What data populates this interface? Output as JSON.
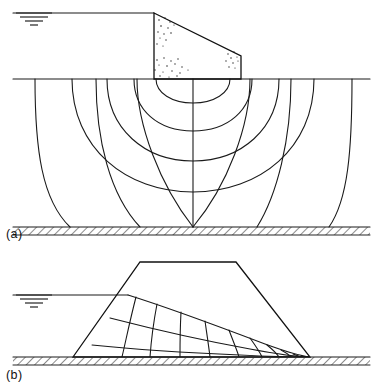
{
  "figure": {
    "background_color": "#ffffff",
    "line_color": "#1a1a1a",
    "width": 381,
    "height": 391,
    "panels": [
      {
        "id": "a",
        "label": "(a)",
        "label_x": 6,
        "label_y": 234,
        "caption": "Flow net for seepage beneath a concrete gravity dam on permeable soil",
        "structure_type": "concrete-gravity-dam",
        "ground_line": {
          "y": 79,
          "x_start": 13,
          "x_end": 370
        },
        "reservoir_water_surface": {
          "y": 13,
          "x_start": 13,
          "x_end": 154
        },
        "impermeable_base": {
          "y": 227,
          "x_start": 13,
          "x_end": 370,
          "thickness": 8
        },
        "dam_outline": [
          [
            154,
            13
          ],
          [
            241,
            56
          ],
          [
            241,
            79
          ],
          [
            154,
            79
          ]
        ],
        "flow_lines_count": 5,
        "equipotential_lines_count": 4,
        "flow_line_exit_x": [
          70,
          140,
          193,
          257,
          329
        ],
        "water_table_symbol": {
          "x": 34,
          "y": 13
        }
      },
      {
        "id": "b",
        "label": "(b)",
        "label_x": 6,
        "label_y": 375,
        "caption": "Flow net for seepage through a homogeneous earth dam with phreatic surface",
        "structure_type": "earth-embankment-dam",
        "ground_line": {
          "y": 357,
          "x_start": 13,
          "x_end": 370
        },
        "reservoir_water_surface": {
          "y": 295,
          "x_start": 13,
          "x_end": 128
        },
        "impermeable_base": {
          "y": 357,
          "x_start": 13,
          "x_end": 370,
          "thickness": 8
        },
        "dam_outline": [
          [
            73,
            357
          ],
          [
            140,
            262
          ],
          [
            236,
            262
          ],
          [
            310,
            357
          ]
        ],
        "phreatic_line_start": [
          128,
          295
        ],
        "discharge_point": [
          310,
          357
        ],
        "flow_lines_count": 3,
        "equipotential_lines_count": 9,
        "water_table_symbol": {
          "x": 34,
          "y": 295
        }
      }
    ],
    "legend_notes": {
      "flow_line": "flow line",
      "equipotential_line": "equipotential line",
      "phreatic_line": "phreatic line",
      "impermeable_boundary": "impermeable boundary (hatched)"
    }
  }
}
